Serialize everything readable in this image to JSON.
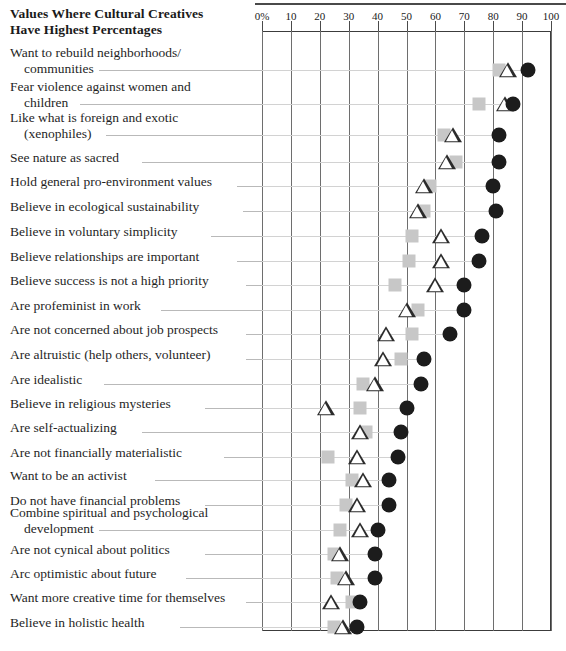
{
  "title": {
    "line1": "Values Where Cultural Creatives",
    "line2": "Have Highest Percentages"
  },
  "axis": {
    "ticks": [
      "0%",
      "10",
      "20",
      "30",
      "40",
      "50",
      "60",
      "70",
      "80",
      "90",
      "100"
    ],
    "min": 0,
    "max": 100,
    "step": 10
  },
  "legend_symbols": {
    "square": "gray-square-marker",
    "triangle": "open-triangle-marker",
    "circle": "black-circle-marker"
  },
  "chart_data": {
    "type": "scatter",
    "title": "Values Where Cultural Creatives Have Highest Percentages",
    "xlabel": "",
    "ylabel": "",
    "xlim": [
      0,
      100
    ],
    "xticks": [
      0,
      10,
      20,
      30,
      40,
      50,
      60,
      70,
      80,
      90,
      100
    ],
    "grid": true,
    "legend_position": "none",
    "orientation": "horizontal",
    "series": [
      {
        "name": "square",
        "marker": "gray-square"
      },
      {
        "name": "triangle",
        "marker": "open-triangle"
      },
      {
        "name": "circle",
        "marker": "black-circle"
      }
    ],
    "categories": [
      "Want to rebuild neighborhoods/ communities",
      "Fear violence against women and children",
      "Like what is foreign and exotic (xenophiles)",
      "See nature as sacred",
      "Hold general pro-environment values",
      "Believe in ecological sustainability",
      "Believe in voluntary simplicity",
      "Believe relationships are important",
      "Believe success is not a high priority",
      "Are profeminist in work",
      "Are not concerned about job prospects",
      "Are altruistic (help others, volunteer)",
      "Are idealistic",
      "Believe in religious mysteries",
      "Are self-actualizing",
      "Are not financially materialistic",
      "Want to be an activist",
      "Do not have financial problems",
      "Combine spiritual and psychological development",
      "Are not cynical about politics",
      "Arc optimistic about future",
      "Want more creative time for themselves",
      "Believe in holistic health"
    ],
    "rows": [
      {
        "label_line1": "Want to rebuild neighborhoods/",
        "label_line2": "communities",
        "square": 82,
        "triangle": 85,
        "circle": 92
      },
      {
        "label_line1": "Fear violence against women and",
        "label_line2": "children",
        "square": 75,
        "triangle": 84,
        "circle": 87
      },
      {
        "label_line1": "Like what is foreign and exotic",
        "label_line2": "(xenophiles)",
        "square": 63,
        "triangle": 66,
        "circle": 82
      },
      {
        "label_line1": "See nature as sacred",
        "label_line2": "",
        "square": 67,
        "triangle": 64,
        "circle": 82
      },
      {
        "label_line1": "Hold general pro-environment values",
        "label_line2": "",
        "square": 58,
        "triangle": 56,
        "circle": 80
      },
      {
        "label_line1": "Believe in ecological sustainability",
        "label_line2": "",
        "square": 56,
        "triangle": 54,
        "circle": 81
      },
      {
        "label_line1": "Believe in voluntary simplicity",
        "label_line2": "",
        "square": 52,
        "triangle": 62,
        "circle": 76
      },
      {
        "label_line1": "Believe relationships are important",
        "label_line2": "",
        "square": 51,
        "triangle": 62,
        "circle": 75
      },
      {
        "label_line1": "Believe success is not a high priority",
        "label_line2": "",
        "square": 46,
        "triangle": 60,
        "circle": 70
      },
      {
        "label_line1": "Are profeminist in work",
        "label_line2": "",
        "square": 54,
        "triangle": 50,
        "circle": 70
      },
      {
        "label_line1": "Are not concerned about job prospects",
        "label_line2": "",
        "square": 52,
        "triangle": 43,
        "circle": 65
      },
      {
        "label_line1": "Are altruistic (help others, volunteer)",
        "label_line2": "",
        "square": 48,
        "triangle": 42,
        "circle": 56
      },
      {
        "label_line1": "Are idealistic",
        "label_line2": "",
        "square": 35,
        "triangle": 39,
        "circle": 55
      },
      {
        "label_line1": "Believe in religious mysteries",
        "label_line2": "",
        "square": 34,
        "triangle": 22,
        "circle": 50
      },
      {
        "label_line1": "Are self-actualizing",
        "label_line2": "",
        "square": 36,
        "triangle": 34,
        "circle": 48
      },
      {
        "label_line1": "Are not financially materialistic",
        "label_line2": "",
        "square": 23,
        "triangle": 33,
        "circle": 47
      },
      {
        "label_line1": "Want to be an activist",
        "label_line2": "",
        "square": 31,
        "triangle": 35,
        "circle": 44
      },
      {
        "label_line1": "Do not have financial problems",
        "label_line2": "",
        "square": 29,
        "triangle": 33,
        "circle": 44
      },
      {
        "label_line1": "Combine spiritual and psychological",
        "label_line2": "development",
        "square": 27,
        "triangle": 34,
        "circle": 40
      },
      {
        "label_line1": "Are not cynical about politics",
        "label_line2": "",
        "square": 25,
        "triangle": 27,
        "circle": 39
      },
      {
        "label_line1": "Arc optimistic about future",
        "label_line2": "",
        "square": 26,
        "triangle": 29,
        "circle": 39
      },
      {
        "label_line1": "Want more creative time for themselves",
        "label_line2": "",
        "square": 31,
        "triangle": 24,
        "circle": 34
      },
      {
        "label_line1": "Believe in holistic health",
        "label_line2": "",
        "square": 25,
        "triangle": 28,
        "circle": 33
      }
    ]
  },
  "layout": {
    "plot_left": 262,
    "plot_top": 31,
    "plot_width": 289,
    "plot_height": 600,
    "row_tops": [
      73,
      110,
      145,
      175,
      201,
      228,
      256,
      283,
      309,
      336,
      363,
      390,
      416,
      443,
      470,
      497,
      523,
      550,
      578,
      604,
      630,
      657,
      683
    ]
  }
}
